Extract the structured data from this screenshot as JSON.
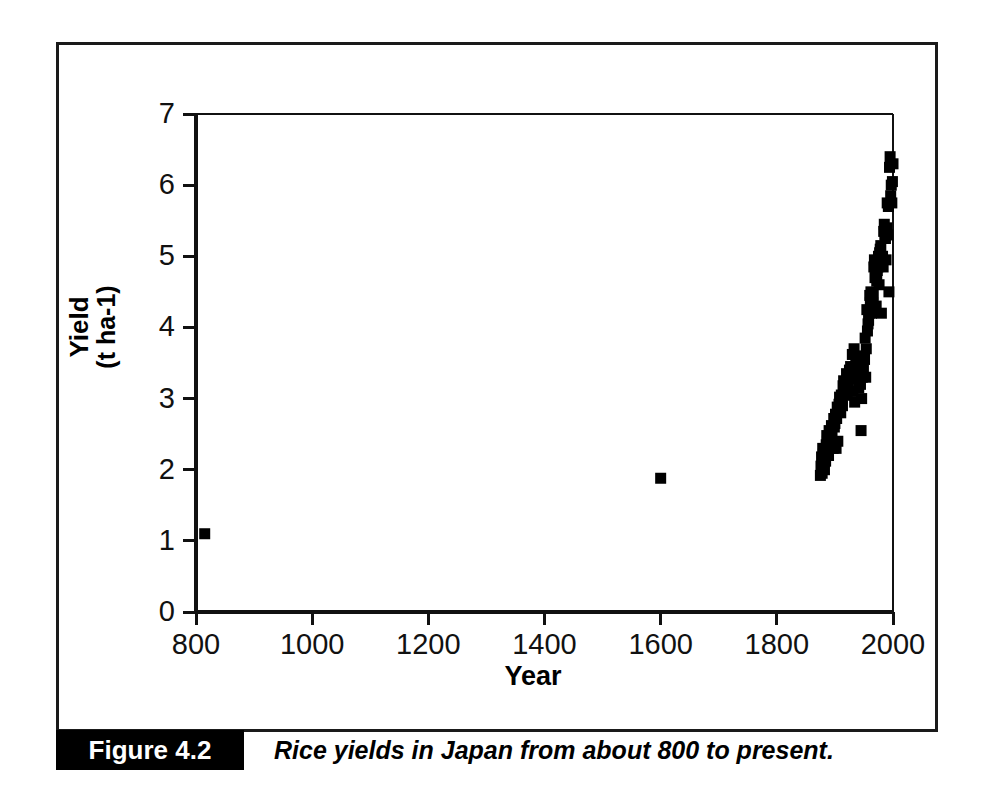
{
  "figure": {
    "number_label": "Figure 4.2",
    "caption": "Rice yields in Japan from about 800 to present."
  },
  "chart_data": {
    "type": "scatter",
    "title": "",
    "xlabel": "Year",
    "ylabel": "Yield\n(t ha-1)",
    "ylabel_line1": "Yield",
    "ylabel_line2": "(t ha-1)",
    "xlim": [
      800,
      2000
    ],
    "ylim": [
      0,
      7
    ],
    "xticks": [
      800,
      1000,
      1200,
      1400,
      1600,
      1800,
      2000
    ],
    "xtick_labels": [
      "800",
      "1000",
      "1200",
      "1400",
      "1600",
      "1800",
      "2000"
    ],
    "yticks": [
      0,
      1,
      2,
      3,
      4,
      5,
      6,
      7
    ],
    "ytick_labels": [
      "0",
      "1",
      "2",
      "3",
      "4",
      "5",
      "6",
      "7"
    ],
    "grid": false,
    "legend": false,
    "marker": "square",
    "marker_color": "#000000",
    "marker_size": 11,
    "series": [
      {
        "name": "Rice yield in Japan",
        "points": [
          [
            815,
            1.1
          ],
          [
            1600,
            1.88
          ],
          [
            1875,
            1.92
          ],
          [
            1876,
            2.05
          ],
          [
            1877,
            2.18
          ],
          [
            1878,
            1.95
          ],
          [
            1879,
            2.3
          ],
          [
            1880,
            2.22
          ],
          [
            1881,
            2.1
          ],
          [
            1882,
            2.0
          ],
          [
            1883,
            2.28
          ],
          [
            1884,
            2.12
          ],
          [
            1885,
            2.35
          ],
          [
            1886,
            2.48
          ],
          [
            1887,
            2.4
          ],
          [
            1888,
            2.3
          ],
          [
            1889,
            2.2
          ],
          [
            1890,
            2.55
          ],
          [
            1891,
            2.35
          ],
          [
            1892,
            2.5
          ],
          [
            1893,
            2.42
          ],
          [
            1894,
            2.62
          ],
          [
            1895,
            2.55
          ],
          [
            1896,
            2.38
          ],
          [
            1897,
            2.3
          ],
          [
            1898,
            2.72
          ],
          [
            1899,
            2.6
          ],
          [
            1900,
            2.65
          ],
          [
            1901,
            2.78
          ],
          [
            1902,
            2.3
          ],
          [
            1903,
            2.72
          ],
          [
            1904,
            2.88
          ],
          [
            1905,
            2.4
          ],
          [
            1906,
            2.85
          ],
          [
            1907,
            2.92
          ],
          [
            1908,
            3.02
          ],
          [
            1909,
            2.95
          ],
          [
            1910,
            2.8
          ],
          [
            1911,
            3.05
          ],
          [
            1912,
            2.98
          ],
          [
            1913,
            2.9
          ],
          [
            1914,
            3.18
          ],
          [
            1915,
            3.25
          ],
          [
            1916,
            3.1
          ],
          [
            1917,
            3.05
          ],
          [
            1918,
            3.12
          ],
          [
            1919,
            3.2
          ],
          [
            1920,
            3.35
          ],
          [
            1921,
            3.05
          ],
          [
            1922,
            3.18
          ],
          [
            1923,
            3.22
          ],
          [
            1924,
            3.3
          ],
          [
            1925,
            3.4
          ],
          [
            1926,
            3.28
          ],
          [
            1927,
            3.45
          ],
          [
            1928,
            3.35
          ],
          [
            1929,
            3.3
          ],
          [
            1930,
            3.62
          ],
          [
            1931,
            3.1
          ],
          [
            1932,
            3.38
          ],
          [
            1933,
            3.7
          ],
          [
            1934,
            2.95
          ],
          [
            1935,
            3.45
          ],
          [
            1936,
            3.58
          ],
          [
            1937,
            3.52
          ],
          [
            1938,
            3.48
          ],
          [
            1939,
            3.55
          ],
          [
            1940,
            3.3
          ],
          [
            1941,
            3.15
          ],
          [
            1942,
            3.4
          ],
          [
            1943,
            3.45
          ],
          [
            1944,
            3.2
          ],
          [
            1945,
            2.55
          ],
          [
            1946,
            3.0
          ],
          [
            1947,
            3.3
          ],
          [
            1948,
            3.45
          ],
          [
            1949,
            3.4
          ],
          [
            1950,
            3.6
          ],
          [
            1951,
            3.55
          ],
          [
            1952,
            3.85
          ],
          [
            1953,
            3.3
          ],
          [
            1954,
            3.7
          ],
          [
            1955,
            4.25
          ],
          [
            1956,
            3.95
          ],
          [
            1957,
            4.05
          ],
          [
            1958,
            4.1
          ],
          [
            1959,
            4.2
          ],
          [
            1960,
            4.45
          ],
          [
            1961,
            4.35
          ],
          [
            1962,
            4.5
          ],
          [
            1963,
            4.2
          ],
          [
            1964,
            4.4
          ],
          [
            1965,
            4.35
          ],
          [
            1966,
            4.45
          ],
          [
            1967,
            4.85
          ],
          [
            1968,
            4.95
          ],
          [
            1969,
            4.7
          ],
          [
            1970,
            4.8
          ],
          [
            1971,
            4.3
          ],
          [
            1972,
            4.65
          ],
          [
            1973,
            4.8
          ],
          [
            1974,
            4.85
          ],
          [
            1975,
            5.0
          ],
          [
            1976,
            4.6
          ],
          [
            1977,
            5.05
          ],
          [
            1978,
            5.1
          ],
          [
            1979,
            5.15
          ],
          [
            1980,
            4.2
          ],
          [
            1981,
            4.9
          ],
          [
            1982,
            5.0
          ],
          [
            1983,
            4.85
          ],
          [
            1984,
            5.35
          ],
          [
            1985,
            5.45
          ],
          [
            1986,
            5.3
          ],
          [
            1987,
            5.25
          ],
          [
            1988,
            4.95
          ],
          [
            1989,
            5.4
          ],
          [
            1990,
            5.75
          ],
          [
            1991,
            5.3
          ],
          [
            1992,
            5.7
          ],
          [
            1993,
            4.5
          ],
          [
            1994,
            6.25
          ],
          [
            1995,
            6.4
          ],
          [
            1996,
            5.85
          ],
          [
            1997,
            6.0
          ],
          [
            1998,
            5.75
          ],
          [
            1999,
            6.05
          ],
          [
            2000,
            6.3
          ]
        ]
      }
    ]
  },
  "axis_geometry": {
    "plot_left_px": 196,
    "plot_right_px": 893,
    "plot_top_px": 114,
    "plot_bottom_px": 612
  }
}
